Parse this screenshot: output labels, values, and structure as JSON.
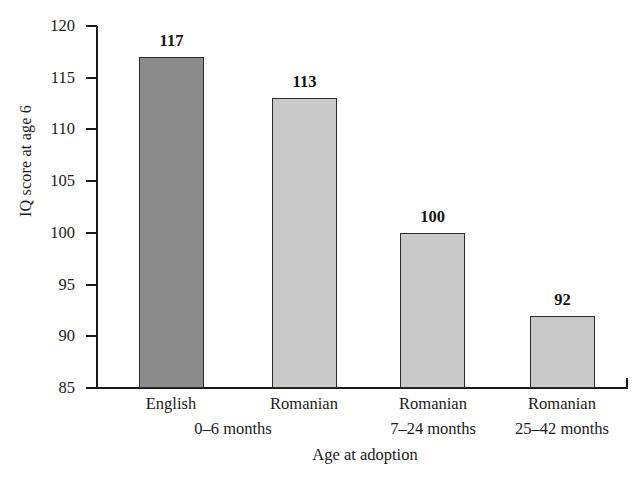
{
  "chart_data": {
    "type": "bar",
    "title": "",
    "xlabel": "Age at adoption",
    "ylabel": "IQ score at age 6",
    "categories": [
      "English",
      "Romanian",
      "Romanian",
      "Romanian"
    ],
    "subcategories": [
      "0–6 months",
      "7–24 months",
      "25–42 months"
    ],
    "category_labels": [
      {
        "line1": "English",
        "line2": "0–6 months"
      },
      {
        "line1": "Romanian",
        "line2": ""
      },
      {
        "line1": "Romanian",
        "line2": "7–24 months"
      },
      {
        "line1": "Romanian",
        "line2": "25–42 months"
      }
    ],
    "values": [
      117,
      113,
      100,
      92
    ],
    "value_labels": [
      "117",
      "113",
      "100",
      "92"
    ],
    "bar_colors": [
      "#8c8c8c",
      "#c9c9c9",
      "#c9c9c9",
      "#c9c9c9"
    ],
    "bar_border_color": "#2b2b2b",
    "ylim": [
      85,
      120
    ],
    "ytick_values": [
      85,
      90,
      95,
      100,
      105,
      110,
      115,
      120
    ],
    "ytick_labels": [
      "85",
      "90",
      "95",
      "100",
      "105",
      "110",
      "115",
      "120"
    ],
    "grid": false,
    "legend": false,
    "legend_position": "none",
    "axis_color": "#1a1a1a",
    "background_color": "#ffffff"
  }
}
